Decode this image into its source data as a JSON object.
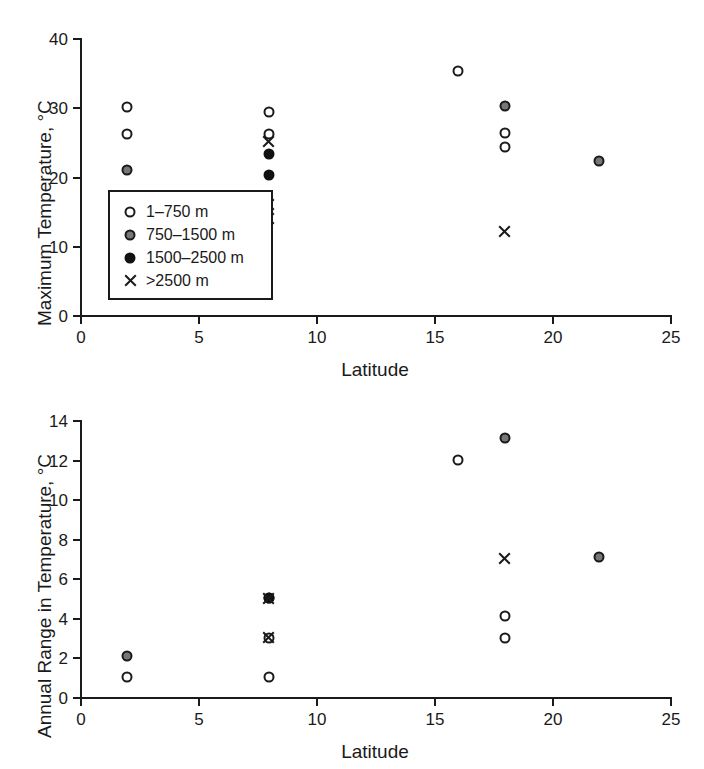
{
  "figure": {
    "panels": [
      {
        "id": "maximum-temperature",
        "xlabel": "Latitude",
        "ylabel": "Maximum Temperature, °C"
      },
      {
        "id": "annual-range",
        "xlabel": "Latitude",
        "ylabel": "Annual Range in Temperature, °C"
      }
    ]
  },
  "legend": {
    "items": [
      {
        "marker": "open-circle",
        "label": "1–750 m"
      },
      {
        "marker": "gray-circle",
        "label": "750–1500 m"
      },
      {
        "marker": "black-circle",
        "label": "1500–2500 m"
      },
      {
        "marker": "cross",
        "label": ">2500 m"
      }
    ]
  },
  "colors": {
    "axis": "#1a1a1a",
    "open_marker_fill": "#ffffff",
    "gray_marker_fill": "#777777",
    "black_marker_fill": "#111111"
  },
  "chart_data": [
    {
      "type": "scatter",
      "title": "",
      "xlabel": "Latitude",
      "ylabel": "Maximum Temperature, °C",
      "xlim": [
        0,
        25
      ],
      "ylim": [
        0,
        40
      ],
      "xticks": [
        0,
        5,
        10,
        15,
        20,
        25
      ],
      "yticks": [
        0,
        10,
        20,
        30,
        40
      ],
      "grid": false,
      "legend_position": "inside-lower-left",
      "series": [
        {
          "name": "1–750 m",
          "marker": "open-circle",
          "points": [
            {
              "x": 2,
              "y": 30.1
            },
            {
              "x": 2,
              "y": 26.2
            },
            {
              "x": 8,
              "y": 29.3
            },
            {
              "x": 8,
              "y": 26.2
            },
            {
              "x": 16,
              "y": 35.3
            },
            {
              "x": 18,
              "y": 26.3
            },
            {
              "x": 18,
              "y": 24.2
            }
          ]
        },
        {
          "name": "750–1500 m",
          "marker": "gray-circle",
          "points": [
            {
              "x": 2,
              "y": 21.0
            },
            {
              "x": 18,
              "y": 30.2
            },
            {
              "x": 22,
              "y": 22.3
            }
          ]
        },
        {
          "name": "1500–2500 m",
          "marker": "black-circle",
          "points": [
            {
              "x": 8,
              "y": 23.2
            },
            {
              "x": 8,
              "y": 20.2
            }
          ]
        },
        {
          "name": ">2500 m",
          "marker": "cross",
          "points": [
            {
              "x": 8,
              "y": 25.1
            },
            {
              "x": 8,
              "y": 16.0
            },
            {
              "x": 8,
              "y": 14.0
            },
            {
              "x": 18,
              "y": 12.0
            }
          ]
        }
      ]
    },
    {
      "type": "scatter",
      "title": "",
      "xlabel": "Latitude",
      "ylabel": "Annual Range in Temperature, °C",
      "xlim": [
        0,
        25
      ],
      "ylim": [
        0,
        14
      ],
      "xticks": [
        0,
        5,
        10,
        15,
        20,
        25
      ],
      "yticks": [
        0,
        2,
        4,
        6,
        8,
        10,
        12,
        14
      ],
      "grid": false,
      "legend_position": "none",
      "series": [
        {
          "name": "1–750 m",
          "marker": "open-circle",
          "points": [
            {
              "x": 2,
              "y": 1.0
            },
            {
              "x": 8,
              "y": 1.0
            },
            {
              "x": 8,
              "y": 3.0
            },
            {
              "x": 8,
              "y": 5.0
            },
            {
              "x": 16,
              "y": 12.0
            },
            {
              "x": 18,
              "y": 4.1
            },
            {
              "x": 18,
              "y": 3.0
            }
          ]
        },
        {
          "name": "750–1500 m",
          "marker": "gray-circle",
          "points": [
            {
              "x": 2,
              "y": 2.05
            },
            {
              "x": 18,
              "y": 13.1
            },
            {
              "x": 22,
              "y": 7.1
            }
          ]
        },
        {
          "name": "1500–2500 m",
          "marker": "black-circle",
          "points": [
            {
              "x": 8,
              "y": 5.0
            }
          ]
        },
        {
          "name": ">2500 m",
          "marker": "cross",
          "points": [
            {
              "x": 8,
              "y": 5.0
            },
            {
              "x": 8,
              "y": 3.0
            },
            {
              "x": 18,
              "y": 7.0
            }
          ]
        }
      ]
    }
  ]
}
